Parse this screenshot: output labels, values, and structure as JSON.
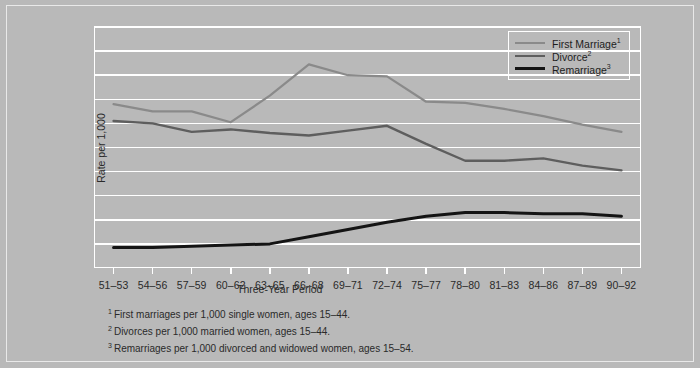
{
  "chart_data": {
    "type": "line",
    "title": "",
    "xlabel": "Three-Year Period",
    "ylabel": "Rate per 1,000",
    "ylim": [
      0,
      200
    ],
    "ytick_step": 20,
    "yticks": [
      0,
      20,
      40,
      60,
      80,
      100,
      120,
      140,
      160,
      180,
      200
    ],
    "grid": true,
    "legend_position": "top-right-inside",
    "categories": [
      "51–53",
      "54–56",
      "57–59",
      "60–62",
      "63–65",
      "66–68",
      "69–71",
      "72–74",
      "75–77",
      "78–80",
      "81–83",
      "84–86",
      "87–89",
      "90–92"
    ],
    "series": [
      {
        "name": "First Marriage",
        "footnote_marker": "1",
        "color": "#8a8a8a",
        "width": 2.2,
        "values": [
          136,
          130,
          130,
          121,
          143,
          169,
          160,
          159,
          138,
          137,
          132,
          126,
          119,
          113
        ]
      },
      {
        "name": "Divorce",
        "footnote_marker": "2",
        "color": "#5e5e5e",
        "width": 2.4,
        "values": [
          122,
          120,
          113,
          115,
          112,
          110,
          114,
          118,
          103,
          89,
          89,
          91,
          85,
          81
        ]
      },
      {
        "name": "Remarriage",
        "footnote_marker": "3",
        "color": "#141414",
        "width": 3.0,
        "values": [
          17,
          17,
          18,
          19,
          20,
          26,
          32,
          38,
          43,
          46,
          46,
          45,
          45,
          43
        ]
      }
    ]
  },
  "legend": {
    "items": [
      {
        "label": "First Marriage",
        "marker": "1"
      },
      {
        "label": "Divorce",
        "marker": "2"
      },
      {
        "label": "Remarriage",
        "marker": "3"
      }
    ]
  },
  "footnotes": [
    {
      "marker": "1",
      "text": "First marriages per 1,000 single women, ages 15–44."
    },
    {
      "marker": "2",
      "text": "Divorces per 1,000 married women, ages 15–44."
    },
    {
      "marker": "3",
      "text": "Remarriages per 1,000 divorced and widowed women, ages 15–54."
    }
  ],
  "colors": {
    "background": "#b9b9b9",
    "frame": "#e9e9e9",
    "gridline": "#ffffff",
    "text": "#2a2a2a"
  }
}
